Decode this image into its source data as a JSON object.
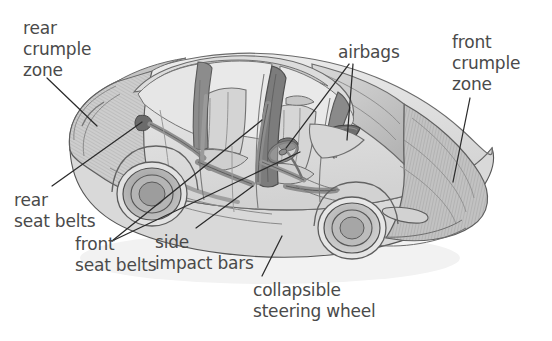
{
  "figure": {
    "view": "three-quarter rear cutaway",
    "background_color": "#ffffff",
    "text_color": "#4a4a4a",
    "line_color": "#2b2b2b"
  },
  "callouts": [
    {
      "id": "rear-crumple-zone",
      "label": "rear\ncrumple\nzone",
      "lines": [
        "rear",
        "crumple",
        "zone"
      ],
      "text_x": 23,
      "text_y": 18,
      "leader": {
        "x1": 47,
        "y1": 78,
        "x2": 97,
        "y2": 126
      }
    },
    {
      "id": "airbags",
      "label": "airbags",
      "lines": [
        "airbags"
      ],
      "text_x": 338,
      "text_y": 42,
      "leader_multi": [
        {
          "x1": 349,
          "y1": 64,
          "x2": 286,
          "y2": 148
        },
        {
          "x1": 352,
          "y1": 64,
          "x2": 347,
          "y2": 140
        }
      ]
    },
    {
      "id": "front-crumple-zone",
      "label": "front\ncrumple\nzone",
      "lines": [
        "front",
        "crumple",
        "zone"
      ],
      "text_x": 452,
      "text_y": 32,
      "leader": {
        "x1": 470,
        "y1": 98,
        "x2": 453,
        "y2": 182
      }
    },
    {
      "id": "rear-seat-belts",
      "label": "rear\nseat belts",
      "lines": [
        "rear",
        "seat belts"
      ],
      "text_x": 14,
      "text_y": 190,
      "leader": {
        "x1": 52,
        "y1": 186,
        "x2": 142,
        "y2": 122
      }
    },
    {
      "id": "front-seat-belts",
      "label": "front\nseat belts",
      "lines": [
        "front",
        "seat belts"
      ],
      "text_x": 75,
      "text_y": 234,
      "leader_multi": [
        {
          "x1": 112,
          "y1": 241,
          "x2": 262,
          "y2": 120
        },
        {
          "x1": 112,
          "y1": 241,
          "x2": 300,
          "y2": 152
        }
      ]
    },
    {
      "id": "side-impact-bars",
      "label": "side\nimpact bars",
      "lines": [
        "side",
        "impact bars"
      ],
      "text_x": 155,
      "text_y": 232,
      "leader": {
        "x1": 196,
        "y1": 228,
        "x2": 253,
        "y2": 186
      }
    },
    {
      "id": "collapsible-steering-wheel",
      "label": "collapsible\nsteering wheel",
      "lines": [
        "collapsible",
        "steering wheel"
      ],
      "text_x": 253,
      "text_y": 280,
      "leader": {
        "x1": 262,
        "y1": 276,
        "x2": 282,
        "y2": 236
      }
    }
  ],
  "car_parts": [
    {
      "name": "rear-crumple-zone-body",
      "shade": "#c9c9c9"
    },
    {
      "name": "front-crumple-zone-hood",
      "shade": "#bdbdbd"
    },
    {
      "name": "passenger-cabin",
      "shade": "#e0e0e0"
    },
    {
      "name": "rear-wheel",
      "shade": "#9a9a9a"
    },
    {
      "name": "front-wheel",
      "shade": "#a5a5a5"
    },
    {
      "name": "b-pillar",
      "shade": "#7f7f7f"
    },
    {
      "name": "seat-belt-webbing",
      "shade": "#8a8a8a"
    },
    {
      "name": "side-impact-bar",
      "shade": "#8f8f8f"
    },
    {
      "name": "airbag-module",
      "shade": "#6f6f6f"
    },
    {
      "name": "steering-wheel",
      "shade": "#9c9c9c"
    },
    {
      "name": "seats",
      "shade": "#d4d4d4"
    }
  ]
}
